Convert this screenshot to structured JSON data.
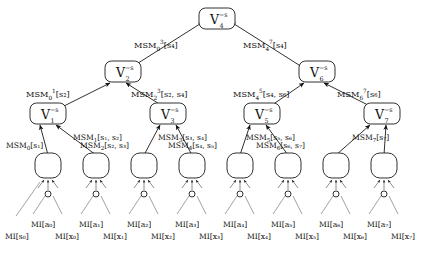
{
  "diagram": {
    "background_color": "#ffffff",
    "stroke_color": "#1a1a1a",
    "levels": 4
  },
  "root": {
    "label": "V",
    "sub": "4",
    "sup": "−s"
  },
  "root_edge_labels": [
    {
      "name": "MSM",
      "sub": "0",
      "sup": "3",
      "args": "[s4]",
      "text": "MSM"
    },
    {
      "name": "MSM",
      "sub": "4",
      "sup": "7",
      "args": "[s4]",
      "text": "MSM"
    }
  ],
  "level2_nodes": [
    {
      "label": "V",
      "sub": "2",
      "sup": "−s"
    },
    {
      "label": "V",
      "sub": "6",
      "sup": "−s"
    }
  ],
  "level2_edge_labels": [
    {
      "name": "MSM",
      "sub": "0",
      "sup": "1",
      "args": "[s2]"
    },
    {
      "name": "MSM",
      "sub": "2",
      "sup": "3",
      "args": "[s2, s4]"
    },
    {
      "name": "MSM",
      "sub": "4",
      "sup": "5",
      "args": "[s4, s6]"
    },
    {
      "name": "MSM",
      "sub": "6",
      "sup": "7",
      "args": "[s6]"
    }
  ],
  "level3_nodes": [
    {
      "label": "V",
      "sub": "1",
      "sup": "−s"
    },
    {
      "label": "V",
      "sub": "3",
      "sup": "−s"
    },
    {
      "label": "V",
      "sub": "5",
      "sup": "−s"
    },
    {
      "label": "V",
      "sub": "7",
      "sup": "−s"
    }
  ],
  "leaf_edge_labels": [
    {
      "name": "MSM",
      "sub": "0",
      "args": "[s1]",
      "row": "lower"
    },
    {
      "name": "MSM",
      "sub": "1",
      "args": "[s1, s2]",
      "row": "upper"
    },
    {
      "name": "MSM",
      "sub": "2",
      "args": "[s2, s3]",
      "row": "lower"
    },
    {
      "name": "MSM",
      "sub": "3",
      "args": "[s3, s4]",
      "row": "upper"
    },
    {
      "name": "MSM",
      "sub": "4",
      "args": "[s4, s5]",
      "row": "lower"
    },
    {
      "name": "MSM",
      "sub": "5",
      "args": "[s5, s6]",
      "row": "upper"
    },
    {
      "name": "MSM",
      "sub": "6",
      "args": "[s6, s7]",
      "row": "lower"
    },
    {
      "name": "MSM",
      "sub": "7",
      "args": "[s7]",
      "row": "upper"
    }
  ],
  "leaf_nodes_count": 8,
  "mi_labels_upper": [
    {
      "name": "MI",
      "args": "[a0]"
    },
    {
      "name": "MI",
      "args": "[a1]"
    },
    {
      "name": "MI",
      "args": "[a2]"
    },
    {
      "name": "MI",
      "args": "[a3]"
    },
    {
      "name": "MI",
      "args": "[a4]"
    },
    {
      "name": "MI",
      "args": "[a5]"
    },
    {
      "name": "MI",
      "args": "[a6]"
    },
    {
      "name": "MI",
      "args": "[a7]"
    }
  ],
  "mi_labels_lower": [
    {
      "name": "MI",
      "args": "[s0]"
    },
    {
      "name": "MI",
      "args": "[x0]"
    },
    {
      "name": "MI",
      "args": "[x1]"
    },
    {
      "name": "MI",
      "args": "[x2]"
    },
    {
      "name": "MI",
      "args": "[x3]"
    },
    {
      "name": "MI",
      "args": "[x4]"
    },
    {
      "name": "MI",
      "args": "[x5]"
    },
    {
      "name": "MI",
      "args": "[x6]"
    },
    {
      "name": "MI",
      "args": "[x7]"
    }
  ]
}
